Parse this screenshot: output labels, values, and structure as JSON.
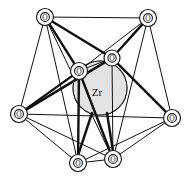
{
  "figure": {
    "kind": "molecular-polyhedron-diagram",
    "width": 186,
    "height": 179,
    "background": "#ffffff",
    "line_color": "#111111",
    "sphere_fill": "#e3e3e3",
    "sphere_stroke": "#2a2a2a"
  },
  "center_atom": {
    "label": "Zr",
    "cx": 100,
    "cy": 88,
    "r": 27
  },
  "ligand_atoms": [
    {
      "id": "o-top-left",
      "label": "O",
      "cx": 45,
      "cy": 17,
      "r": 8.5
    },
    {
      "id": "o-top-right",
      "label": "O",
      "cx": 148,
      "cy": 18,
      "r": 8.5
    },
    {
      "id": "o-mid-left",
      "label": "O",
      "cx": 79,
      "cy": 71,
      "r": 8.5
    },
    {
      "id": "o-mid-right",
      "label": "O",
      "cx": 112,
      "cy": 58,
      "r": 8.0
    },
    {
      "id": "o-left",
      "label": "O",
      "cx": 19,
      "cy": 114,
      "r": 8.5
    },
    {
      "id": "o-right",
      "label": "O",
      "cx": 172,
      "cy": 118,
      "r": 8.5
    },
    {
      "id": "o-bottom-left",
      "label": "O",
      "cx": 78,
      "cy": 163,
      "r": 8.5
    },
    {
      "id": "o-bottom-right",
      "label": "O",
      "cx": 113,
      "cy": 159,
      "r": 8.5
    }
  ],
  "edges": [
    {
      "from": "o-top-left",
      "to": "o-top-right",
      "weight": "thin"
    },
    {
      "from": "o-top-left",
      "to": "o-left",
      "weight": "thin"
    },
    {
      "from": "o-top-left",
      "to": "o-mid-left",
      "weight": "thick"
    },
    {
      "from": "o-top-left",
      "to": "o-mid-right",
      "weight": "thick"
    },
    {
      "from": "o-top-left",
      "to": "o-bottom-left",
      "weight": "thin"
    },
    {
      "from": "o-top-left",
      "to": "o-bottom-right",
      "weight": "thin"
    },
    {
      "from": "o-top-right",
      "to": "o-right",
      "weight": "thin"
    },
    {
      "from": "o-top-right",
      "to": "o-mid-left",
      "weight": "thin"
    },
    {
      "from": "o-top-right",
      "to": "o-mid-right",
      "weight": "thick"
    },
    {
      "from": "o-top-right",
      "to": "o-bottom-right",
      "weight": "thin"
    },
    {
      "from": "o-left",
      "to": "o-mid-left",
      "weight": "thick"
    },
    {
      "from": "o-left",
      "to": "o-mid-right",
      "weight": "thick"
    },
    {
      "from": "o-left",
      "to": "o-bottom-left",
      "weight": "thin"
    },
    {
      "from": "o-left",
      "to": "o-bottom-right",
      "weight": "thin"
    },
    {
      "from": "o-left",
      "to": "o-right",
      "weight": "thin"
    },
    {
      "from": "o-right",
      "to": "o-mid-right",
      "weight": "thick"
    },
    {
      "from": "o-right",
      "to": "o-bottom-right",
      "weight": "thin"
    },
    {
      "from": "o-right",
      "to": "o-bottom-left",
      "weight": "thin"
    },
    {
      "from": "o-bottom-left",
      "to": "o-bottom-right",
      "weight": "thin"
    },
    {
      "from": "o-mid-left",
      "to": "o-mid-right",
      "weight": "thin"
    },
    {
      "from": "o-mid-left",
      "to": "o-bottom-left",
      "weight": "thick"
    },
    {
      "from": "o-mid-left",
      "to": "o-bottom-right",
      "weight": "thick"
    },
    {
      "from": "o-mid-right",
      "to": "o-bottom-right",
      "weight": "thin"
    }
  ]
}
